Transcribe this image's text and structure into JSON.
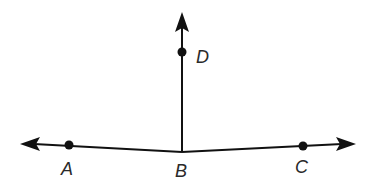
{
  "diagram": {
    "type": "geometry",
    "colors": {
      "stroke": "#111111",
      "label": "#2a2a2a",
      "background": "#ffffff"
    },
    "points": {
      "A": {
        "label": "A",
        "x": 69,
        "y": 145,
        "label_x": 68,
        "label_y": 175
      },
      "B": {
        "label": "B",
        "x": 182,
        "y": 152,
        "label_x": 182,
        "label_y": 177
      },
      "C": {
        "label": "C",
        "x": 303,
        "y": 146,
        "label_x": 302,
        "label_y": 173
      },
      "D": {
        "label": "D",
        "x": 182,
        "y": 52,
        "label_x": 203,
        "label_y": 63
      }
    },
    "rays": [
      {
        "name": "ray-BA",
        "from": "B",
        "through": "A",
        "tip": [
          20,
          144
        ]
      },
      {
        "name": "ray-BC",
        "from": "B",
        "through": "C",
        "tip": [
          356,
          144
        ]
      },
      {
        "name": "ray-BD",
        "from": "B",
        "through": "D",
        "tip": [
          182,
          12
        ]
      }
    ]
  }
}
